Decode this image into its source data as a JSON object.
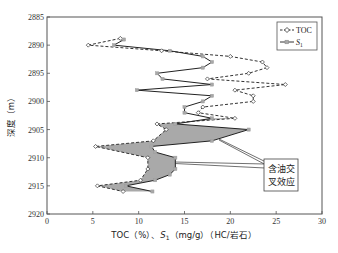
{
  "chart_data": {
    "type": "line",
    "title": "",
    "xlabel": "TOC（%）、S1（mg/g）（HC/岩石）",
    "ylabel": "深度（m）",
    "xlim": [
      0,
      30
    ],
    "ylim": [
      2920,
      2885
    ],
    "y_inverted": true,
    "x_ticks": [
      0,
      5,
      10,
      15,
      20,
      25,
      30
    ],
    "y_ticks": [
      2885,
      2890,
      2895,
      2900,
      2905,
      2910,
      2915,
      2920
    ],
    "grid": false,
    "legend_position": "upper right",
    "series": [
      {
        "name": "TOC",
        "style": "dashed line, open diamond markers",
        "color": "#333333",
        "points": [
          [
            8.0,
            2888.8
          ],
          [
            4.5,
            2890.0
          ],
          [
            12.5,
            2891.0
          ],
          [
            20.0,
            2892.0
          ],
          [
            23.5,
            2893.0
          ],
          [
            24.0,
            2894.0
          ],
          [
            22.0,
            2895.0
          ],
          [
            17.5,
            2896.0
          ],
          [
            26.0,
            2897.0
          ],
          [
            20.5,
            2898.0
          ],
          [
            22.5,
            2899.0
          ],
          [
            22.5,
            2900.0
          ],
          [
            17.0,
            2901.0
          ],
          [
            16.5,
            2902.0
          ],
          [
            20.5,
            2903.0
          ],
          [
            12.0,
            2904.0
          ],
          [
            13.0,
            2905.0
          ],
          [
            11.6,
            2907.0
          ],
          [
            5.3,
            2908.0
          ],
          [
            11.0,
            2910.0
          ],
          [
            11.0,
            2912.0
          ],
          [
            10.2,
            2914.0
          ],
          [
            5.5,
            2915.0
          ],
          [
            8.3,
            2916.0
          ]
        ]
      },
      {
        "name": "S1",
        "style": "solid line, gray square markers",
        "color": "#333333",
        "marker_color": "#a8a8a8",
        "points": [
          [
            8.4,
            2889.0
          ],
          [
            7.3,
            2890.0
          ],
          [
            13.4,
            2891.0
          ],
          [
            17.0,
            2892.0
          ],
          [
            18.0,
            2893.0
          ],
          [
            17.0,
            2894.0
          ],
          [
            12.0,
            2895.0
          ],
          [
            12.6,
            2896.0
          ],
          [
            18.0,
            2897.0
          ],
          [
            9.8,
            2898.0
          ],
          [
            18.0,
            2899.0
          ],
          [
            17.0,
            2900.0
          ],
          [
            15.0,
            2901.0
          ],
          [
            15.0,
            2902.0
          ],
          [
            18.0,
            2903.0
          ],
          [
            14.0,
            2904.0
          ],
          [
            22.0,
            2905.0
          ],
          [
            18.0,
            2907.0
          ],
          [
            11.4,
            2908.0
          ],
          [
            11.8,
            2909.0
          ],
          [
            14.0,
            2910.0
          ],
          [
            14.0,
            2912.0
          ],
          [
            13.4,
            2913.0
          ],
          [
            11.8,
            2914.0
          ],
          [
            8.6,
            2915.0
          ],
          [
            11.5,
            2916.0
          ]
        ]
      }
    ],
    "shaded_region": {
      "description": "Gray fill between TOC and S1 curves where S1 exceeds TOC",
      "depth_range": [
        2903.5,
        2916.0
      ],
      "color": "#a9a9a9"
    },
    "annotations": [
      {
        "text_line1": "含油交",
        "text_line2": "叉效应",
        "meaning": "oil crossover effect",
        "box": true,
        "pointers_to_depths": [
          2907,
          2911
        ]
      }
    ]
  },
  "axes": {
    "x_label_prefix": "TOC（%）、",
    "x_label_s": "S",
    "x_label_sub": "1",
    "x_label_suffix": "（mg/g）（HC/岩石）",
    "y_label": "深度（m）",
    "x_tick_labels": [
      "0",
      "5",
      "10",
      "15",
      "20",
      "25",
      "30"
    ],
    "y_tick_labels": [
      "2885",
      "2890",
      "2895",
      "2900",
      "2905",
      "2910",
      "2915",
      "2920"
    ]
  },
  "legend": {
    "toc_label": "TOC",
    "s1_label": "S",
    "s1_sub": "1"
  },
  "annotation": {
    "line1": "含油交",
    "line2": "叉效应"
  }
}
